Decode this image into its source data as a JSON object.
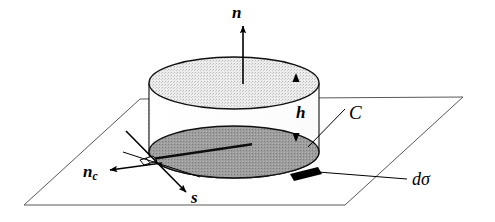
{
  "figure": {
    "kind": "geometry-diagram",
    "background_color": "#ffffff",
    "line_color": "#000000",
    "plane_line_color": "#555555",
    "top_disc_fill": "#e3e3e3",
    "bottom_disc_fill": "#9a9a9a",
    "patch_fill": "#000000"
  },
  "labels": {
    "normal": "n",
    "height": "h",
    "curve": "C",
    "contour_normal_base": "n",
    "contour_normal_sub": "c",
    "tangent": "s",
    "surface_element": "dσ"
  },
  "elements": {
    "plane": "reference-plane-parallelogram",
    "cylinder": "pillbox-cylinder",
    "top_disc": "cylinder-top-disc",
    "bottom_disc": "cylinder-bottom-disc",
    "normal_arrow": "outward-normal-arrow",
    "up_arrowhead": "top-face-up-arrowhead",
    "down_arrowhead": "bottom-face-down-arrowhead",
    "contour_normal_arrow": "contour-normal-arrow",
    "tangent_arrow": "tangent-vector-arrow",
    "curve_leader": "curve-C-leader-line",
    "dsigma_leader": "d-sigma-leader-line",
    "dsigma_patch": "d-sigma-black-patch",
    "edge_marker": "rim-edge-marker",
    "dotted_guide": "hidden-edge-dotted-guide"
  }
}
